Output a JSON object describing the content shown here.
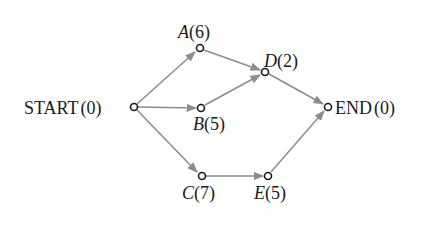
{
  "diagram": {
    "type": "activity-network",
    "colors": {
      "edge": "#8c8c8c",
      "node_stroke": "#1a1a1a",
      "text": "#1a1a1a",
      "background": "#ffffff"
    },
    "nodes": [
      {
        "id": "START",
        "name": "START",
        "value": "(0)",
        "x": 134,
        "y": 107,
        "italic": false
      },
      {
        "id": "A",
        "name": "A",
        "value": "(6)",
        "x": 200,
        "y": 48,
        "italic": true
      },
      {
        "id": "B",
        "name": "B",
        "value": "(5)",
        "x": 201,
        "y": 108,
        "italic": true
      },
      {
        "id": "C",
        "name": "C",
        "value": "(7)",
        "x": 202,
        "y": 176,
        "italic": true
      },
      {
        "id": "D",
        "name": "D",
        "value": "(2)",
        "x": 265,
        "y": 72,
        "italic": true
      },
      {
        "id": "E",
        "name": "E",
        "value": "(5)",
        "x": 268,
        "y": 176,
        "italic": true
      },
      {
        "id": "END",
        "name": "END",
        "value": "(0)",
        "x": 328,
        "y": 107,
        "italic": false
      }
    ],
    "edges": [
      {
        "from": "START",
        "to": "A"
      },
      {
        "from": "START",
        "to": "B"
      },
      {
        "from": "START",
        "to": "C"
      },
      {
        "from": "A",
        "to": "D"
      },
      {
        "from": "B",
        "to": "D"
      },
      {
        "from": "D",
        "to": "END"
      },
      {
        "from": "C",
        "to": "E"
      },
      {
        "from": "E",
        "to": "END"
      }
    ],
    "labels": {
      "START": {
        "name": "START",
        "value": "(0)"
      },
      "A": {
        "name": "A",
        "value": "(6)"
      },
      "B": {
        "name": "B",
        "value": "(5)"
      },
      "C": {
        "name": "C",
        "value": "(7)"
      },
      "D": {
        "name": "D",
        "value": "(2)"
      },
      "E": {
        "name": "E",
        "value": "(5)"
      },
      "END": {
        "name": "END",
        "value": "(0)"
      }
    }
  }
}
